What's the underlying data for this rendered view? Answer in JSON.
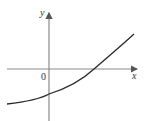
{
  "diagram": {
    "type": "function-graph",
    "axes": {
      "x_label": "x",
      "y_label": "y",
      "origin_label": "0",
      "axis_color": "#8a8a8a"
    },
    "curve": {
      "color": "#2a2a2a",
      "description": "increasing concave-up curve crossing negative y-intercept and positive x-intercept"
    }
  }
}
